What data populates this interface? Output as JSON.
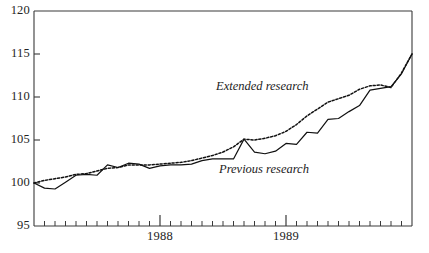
{
  "chart_data": {
    "type": "line",
    "title": "",
    "xlabel": "",
    "ylabel": "",
    "grid": false,
    "legend_position": "inline-annotation",
    "ylim": [
      95,
      120
    ],
    "ytick_labels": [
      "95",
      "100",
      "105",
      "110",
      "115",
      "120"
    ],
    "ytick_values": [
      95,
      100,
      105,
      110,
      115,
      120
    ],
    "xlim": [
      0,
      36
    ],
    "xtick_labels": [
      "1988",
      "1989"
    ],
    "xtick_values": [
      12,
      24
    ],
    "x_minor_tick_count": 36,
    "x_major_tick_values": [
      12,
      24
    ],
    "x": [
      0,
      1,
      2,
      3,
      4,
      5,
      6,
      7,
      8,
      9,
      10,
      11,
      12,
      13,
      14,
      15,
      16,
      17,
      18,
      19,
      20,
      21,
      22,
      23,
      24,
      25,
      26,
      27,
      28,
      29,
      30,
      31,
      32,
      33,
      34,
      35,
      36
    ],
    "series": [
      {
        "name": "Previous research",
        "style": "solid",
        "color": "#111111",
        "values": [
          100.0,
          99.4,
          99.3,
          100.1,
          100.9,
          101.0,
          100.9,
          102.1,
          101.8,
          102.3,
          102.2,
          101.7,
          102.0,
          102.1,
          102.1,
          102.2,
          102.6,
          102.8,
          102.8,
          102.8,
          105.1,
          103.6,
          103.4,
          103.7,
          104.6,
          104.5,
          105.9,
          105.8,
          107.4,
          107.5,
          108.3,
          109.0,
          110.8,
          111.0,
          111.2,
          112.7,
          115.0
        ]
      },
      {
        "name": "Extended research",
        "style": "dotted",
        "color": "#111111",
        "values": [
          100.0,
          100.3,
          100.5,
          100.7,
          101.0,
          101.1,
          101.4,
          101.7,
          101.8,
          102.1,
          102.1,
          102.1,
          102.2,
          102.3,
          102.4,
          102.6,
          102.9,
          103.2,
          103.6,
          104.2,
          105.1,
          105.0,
          105.2,
          105.5,
          106.0,
          106.8,
          107.8,
          108.6,
          109.4,
          109.8,
          110.2,
          110.9,
          111.3,
          111.4,
          111.1,
          112.8,
          115.0
        ]
      }
    ],
    "annotations": [
      {
        "text": "Extended research",
        "x_px": 216,
        "y_px": 79
      },
      {
        "text": "Previous research",
        "x_px": 219,
        "y_px": 162
      }
    ]
  }
}
